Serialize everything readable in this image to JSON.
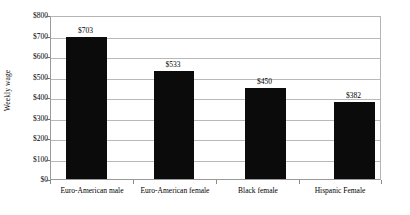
{
  "chart_data": {
    "type": "bar",
    "title": "",
    "xlabel": "",
    "ylabel": "Weekly wage",
    "categories": [
      "Euro-American male",
      "Euro-American female",
      "Black female",
      "Hispanic Female"
    ],
    "values": [
      703,
      533,
      450,
      382
    ],
    "value_labels": [
      "$703",
      "$533",
      "$450",
      "$382"
    ],
    "ylim": [
      0,
      800
    ],
    "ytick_values": [
      0,
      100,
      200,
      300,
      400,
      500,
      600,
      700,
      800
    ],
    "ytick_labels": [
      "$0",
      "$100",
      "$200",
      "$300",
      "$400",
      "$500",
      "$600",
      "$700",
      "$800"
    ],
    "grid": true,
    "legend": null,
    "bar_color": "#0b0b0b",
    "gridline_color": "#b9b9b9",
    "axis_color": "#9a9a9a",
    "background_color": "#ffffff"
  }
}
